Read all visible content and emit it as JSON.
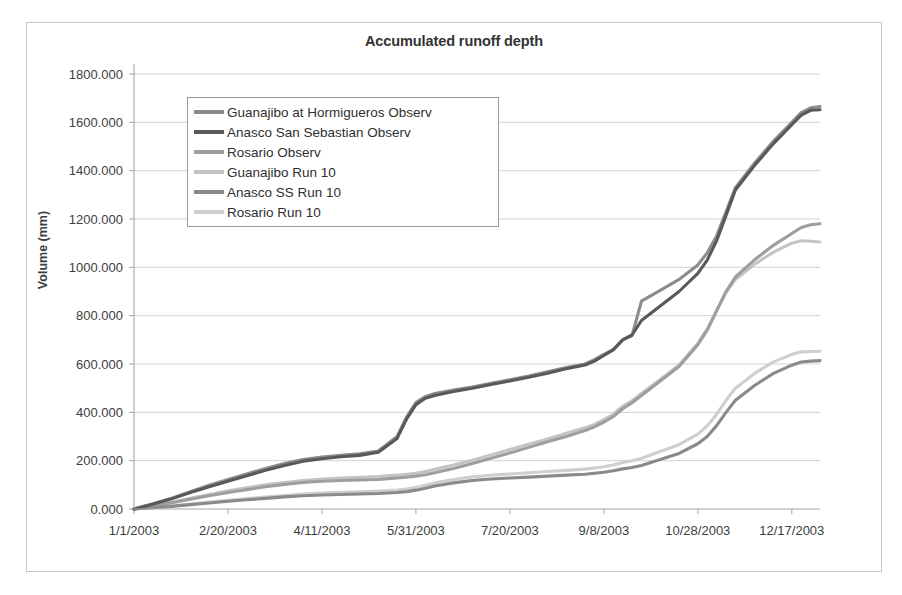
{
  "chart_data": {
    "type": "line",
    "title": "Accumulated runoff depth",
    "xlabel": "",
    "ylabel": "Volume (mm)",
    "grid": true,
    "legend_position": "upper-left-inside",
    "ylim": [
      0,
      1800
    ],
    "ytick_labels": [
      "0.000",
      "200.000",
      "400.000",
      "600.000",
      "800.000",
      "1000.000",
      "1200.000",
      "1400.000",
      "1600.000",
      "1800.000"
    ],
    "ytick_values": [
      0,
      200,
      400,
      600,
      800,
      1000,
      1200,
      1400,
      1600,
      1800
    ],
    "xtick_labels": [
      "1/1/2003",
      "2/20/2003",
      "4/11/2003",
      "5/31/2003",
      "7/20/2003",
      "9/8/2003",
      "10/28/2003",
      "12/17/2003"
    ],
    "xtick_values": [
      0,
      50,
      100,
      150,
      200,
      250,
      300,
      350
    ],
    "xlim": [
      0,
      365
    ],
    "x": [
      0,
      10,
      20,
      30,
      40,
      50,
      60,
      70,
      80,
      90,
      100,
      110,
      120,
      130,
      140,
      145,
      150,
      155,
      160,
      170,
      180,
      190,
      200,
      210,
      220,
      230,
      240,
      245,
      250,
      255,
      260,
      265,
      270,
      280,
      290,
      300,
      305,
      310,
      315,
      320,
      330,
      340,
      350,
      355,
      360,
      365
    ],
    "series": [
      {
        "name": "Guanajibo at Hormigueros Observ",
        "color": "#8c8c8c",
        "values": [
          0,
          22,
          45,
          72,
          98,
          122,
          145,
          168,
          188,
          205,
          215,
          222,
          228,
          240,
          300,
          380,
          440,
          465,
          478,
          492,
          505,
          520,
          535,
          550,
          568,
          585,
          600,
          618,
          640,
          660,
          700,
          718,
          860,
          905,
          950,
          1010,
          1060,
          1130,
          1230,
          1330,
          1430,
          1520,
          1600,
          1640,
          1660,
          1665
        ]
      },
      {
        "name": "Anasco San Sebastian Observ",
        "color": "#595959",
        "values": [
          0,
          20,
          42,
          68,
          92,
          115,
          138,
          160,
          180,
          198,
          208,
          216,
          222,
          235,
          292,
          372,
          432,
          458,
          470,
          486,
          500,
          515,
          530,
          545,
          562,
          580,
          596,
          612,
          635,
          658,
          700,
          720,
          780,
          840,
          900,
          975,
          1030,
          1110,
          1215,
          1320,
          1420,
          1510,
          1590,
          1630,
          1650,
          1652
        ]
      },
      {
        "name": "Rosario Observ",
        "color": "#9e9e9e",
        "values": [
          0,
          12,
          26,
          40,
          55,
          68,
          80,
          92,
          102,
          110,
          115,
          118,
          120,
          122,
          128,
          132,
          136,
          142,
          150,
          168,
          188,
          210,
          232,
          255,
          278,
          300,
          325,
          340,
          360,
          382,
          415,
          440,
          470,
          530,
          590,
          680,
          740,
          820,
          900,
          960,
          1030,
          1090,
          1140,
          1165,
          1176,
          1180
        ]
      },
      {
        "name": "Guanajibo Run 10",
        "color": "#c4c4c4",
        "values": [
          0,
          14,
          28,
          44,
          60,
          75,
          88,
          100,
          110,
          118,
          124,
          128,
          131,
          134,
          140,
          144,
          148,
          155,
          164,
          182,
          202,
          224,
          246,
          268,
          290,
          313,
          336,
          350,
          370,
          392,
          425,
          448,
          478,
          536,
          596,
          686,
          744,
          822,
          896,
          950,
          1012,
          1062,
          1100,
          1110,
          1108,
          1105
        ]
      },
      {
        "name": "Anasco SS Run 10",
        "color": "#8a8a8a",
        "values": [
          0,
          5,
          11,
          18,
          25,
          32,
          38,
          44,
          50,
          55,
          58,
          60,
          62,
          64,
          68,
          72,
          78,
          86,
          95,
          108,
          118,
          124,
          128,
          132,
          136,
          140,
          144,
          148,
          152,
          158,
          166,
          172,
          180,
          205,
          230,
          270,
          300,
          345,
          400,
          450,
          510,
          560,
          595,
          608,
          612,
          614
        ]
      },
      {
        "name": "Rosario Run 10",
        "color": "#cfcfcf",
        "values": [
          0,
          6,
          13,
          21,
          29,
          36,
          43,
          50,
          56,
          62,
          66,
          69,
          71,
          74,
          78,
          83,
          90,
          98,
          108,
          122,
          133,
          140,
          145,
          150,
          155,
          160,
          165,
          170,
          175,
          182,
          192,
          200,
          210,
          238,
          266,
          310,
          344,
          392,
          450,
          500,
          560,
          608,
          640,
          650,
          652,
          653
        ]
      }
    ]
  }
}
